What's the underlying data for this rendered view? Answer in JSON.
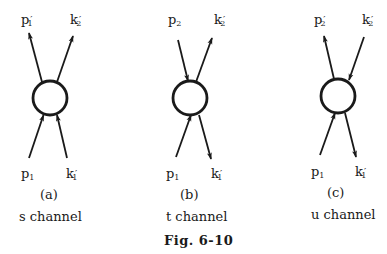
{
  "figure_caption": "Fig. 6-10",
  "colors": {
    "ink": "#1a1a1a",
    "background": "#ffffff"
  },
  "panels": [
    {
      "id": "a",
      "sublabel": "(a)",
      "channel": "s  channel",
      "labels": {
        "top_left": {
          "base": "p",
          "sub": "1",
          "prime": "′"
        },
        "top_right": {
          "base": "k",
          "sub": "2",
          "prime": "′"
        },
        "bottom_left": {
          "base": "p",
          "sub": "1",
          "prime": ""
        },
        "bottom_right": {
          "base": "k",
          "sub": "1",
          "prime": "′"
        }
      },
      "lines": {
        "top_left": "outgoing",
        "top_right": "outgoing",
        "bottom_left": "incoming",
        "bottom_right": "incoming"
      }
    },
    {
      "id": "b",
      "sublabel": "(b)",
      "channel": "t  channel",
      "labels": {
        "top_left": {
          "base": "p",
          "sub": "2",
          "prime": ""
        },
        "top_right": {
          "base": "k",
          "sub": "2",
          "prime": "′"
        },
        "bottom_left": {
          "base": "p",
          "sub": "1",
          "prime": ""
        },
        "bottom_right": {
          "base": "k",
          "sub": "1",
          "prime": "′"
        }
      },
      "lines": {
        "top_left": "incoming",
        "top_right": "outgoing",
        "bottom_left": "incoming",
        "bottom_right": "outgoing"
      }
    },
    {
      "id": "c",
      "sublabel": "(c)",
      "channel": "u  channel",
      "labels": {
        "top_left": {
          "base": "p",
          "sub": "2",
          "prime": "′"
        },
        "top_right": {
          "base": "k",
          "sub": "2",
          "prime": "′"
        },
        "bottom_left": {
          "base": "p",
          "sub": "1",
          "prime": ""
        },
        "bottom_right": {
          "base": "k",
          "sub": "1",
          "prime": "′"
        }
      },
      "lines": {
        "top_left": "outgoing",
        "top_right": "incoming",
        "bottom_left": "incoming",
        "bottom_right": "outgoing"
      }
    }
  ]
}
